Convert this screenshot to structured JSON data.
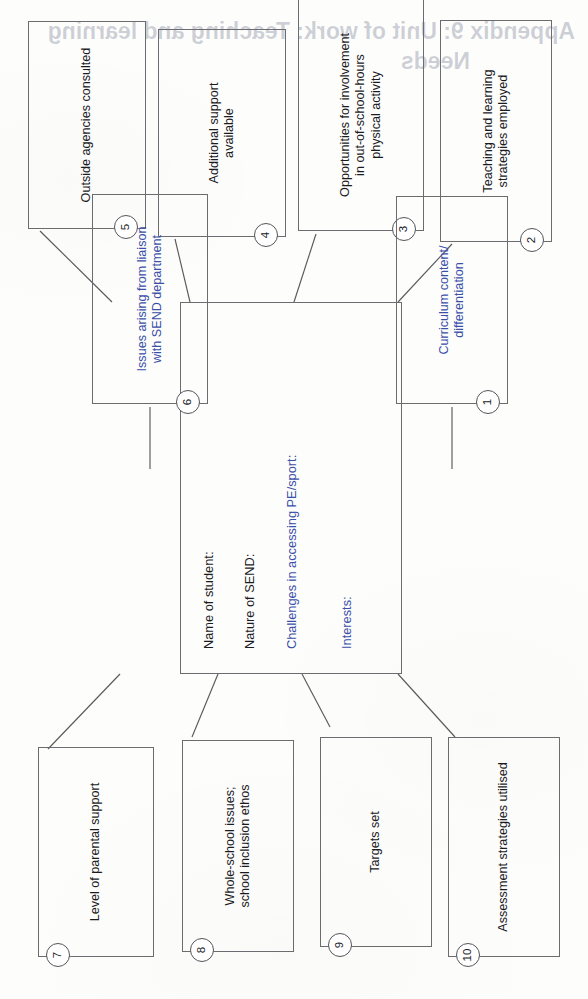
{
  "document": {
    "type": "spider-diagram",
    "orientation": "rotated-90-ccw",
    "bleed_through_title": "Appendix 9: Unit of work: Teaching and learning",
    "bleed_through_subtitle": "Needs"
  },
  "center": {
    "name": "student-profile-box",
    "fields": [
      {
        "label": "Name of student:",
        "accent": false
      },
      {
        "label": "Nature of SEND:",
        "accent": false
      },
      {
        "label": "Challenges in accessing PE/sport:",
        "accent": true
      },
      {
        "label": "Interests:",
        "accent": true
      }
    ]
  },
  "nodes": [
    {
      "number": "1",
      "label": "Curriculum content/\ndifferentiation",
      "accent": true
    },
    {
      "number": "2",
      "label": "Teaching and learning\nstrategies employed",
      "accent": false
    },
    {
      "number": "3",
      "label": "Opportunities for involvement\nin out-of-school-hours\nphysical activity",
      "accent": false
    },
    {
      "number": "4",
      "label": "Additional support\navailable",
      "accent": false
    },
    {
      "number": "5",
      "label": "Outside agencies consulted",
      "accent": false
    },
    {
      "number": "6",
      "label": "Issues arising from liaison\nwith SEND department",
      "accent": true
    },
    {
      "number": "7",
      "label": "Level of parental support",
      "accent": false
    },
    {
      "number": "8",
      "label": "Whole-school issues;\nschool inclusion ethos",
      "accent": false
    },
    {
      "number": "9",
      "label": "Targets set",
      "accent": false
    },
    {
      "number": "10",
      "label": "Assessment strategies utilised",
      "accent": false
    }
  ],
  "colors": {
    "line": "#5a5a5e",
    "box_border": "#6b6b70",
    "text": "#1b1b1f",
    "accent_text": "#3a4fa8",
    "paper": "#fdfdfc"
  }
}
